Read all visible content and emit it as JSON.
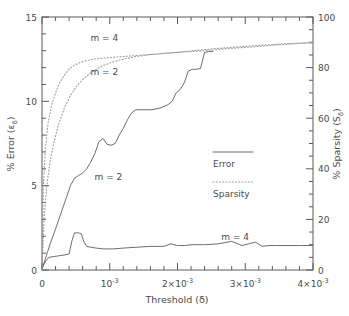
{
  "chart_data": {
    "type": "line",
    "title": "",
    "xlabel": "Threshold (δ)",
    "ylabel": "% Error (εδ)",
    "y2label": "% Sparsity (Sδ)",
    "xlim": [
      0,
      0.004
    ],
    "ylim": [
      0,
      15
    ],
    "y2lim": [
      0,
      100
    ],
    "grid": false,
    "legend_position": "center-right",
    "xticks": [
      0,
      0.001,
      0.002,
      0.003,
      0.004
    ],
    "xticklabels": [
      "0",
      "10⁻³",
      "2×10⁻³",
      "3×10⁻³",
      "4×10⁻³"
    ],
    "yticks": [
      0,
      5,
      10,
      15
    ],
    "yticklabels": [
      "0",
      "5",
      "10",
      "15"
    ],
    "y2ticks": [
      0,
      20,
      40,
      60,
      80,
      100
    ],
    "y2ticklabels": [
      "0",
      "20",
      "40",
      "60",
      "80",
      "100"
    ],
    "legend": [
      {
        "label": "Error",
        "style": "solid"
      },
      {
        "label": "Sparsity",
        "style": "dotted"
      }
    ],
    "annotations": [
      {
        "text": "m = 4",
        "x": 0.00092,
        "y": 13.6,
        "series": "sparsity-m4"
      },
      {
        "text": "m = 2",
        "x": 0.00092,
        "y": 11.55,
        "series": "sparsity-m2"
      },
      {
        "text": "m = 2",
        "x": 0.00098,
        "y": 5.35,
        "series": "error-m2"
      },
      {
        "text": "m = 4",
        "x": 0.00285,
        "y": 1.75,
        "series": "error-m4"
      }
    ],
    "series": [
      {
        "name": "Error m = 2",
        "axis": "left",
        "style": "solid",
        "label": "m = 2",
        "x": [
          0.0,
          4e-05,
          8e-05,
          0.00012,
          0.00018,
          0.00024,
          0.0003,
          0.00036,
          0.00042,
          0.00048,
          0.00054,
          0.0006,
          0.00066,
          0.00072,
          0.00078,
          0.00084,
          0.0009,
          0.00096,
          0.00102,
          0.00108,
          0.00114,
          0.0012,
          0.00126,
          0.00132,
          0.00138,
          0.0015,
          0.00162,
          0.00174,
          0.00186,
          0.00192,
          0.00198,
          0.00204,
          0.0021,
          0.00216,
          0.00222,
          0.00228,
          0.00234,
          0.0024,
          0.00246,
          0.00252
        ],
        "y": [
          0.05,
          0.55,
          1.05,
          1.55,
          2.2,
          2.9,
          3.6,
          4.3,
          5.0,
          5.45,
          5.6,
          5.75,
          6.0,
          6.4,
          6.9,
          7.6,
          7.8,
          7.45,
          7.4,
          7.5,
          8.0,
          8.4,
          8.9,
          9.3,
          9.5,
          9.5,
          9.5,
          9.6,
          9.8,
          10.0,
          10.5,
          10.7,
          11.1,
          11.8,
          11.9,
          11.9,
          11.95,
          12.9,
          12.95,
          12.95
        ]
      },
      {
        "name": "Error m = 4",
        "axis": "left",
        "style": "solid",
        "label": "m = 4",
        "x": [
          0.0,
          4e-05,
          0.0001,
          0.00018,
          0.00026,
          0.00034,
          0.0004,
          0.00044,
          0.00048,
          0.00054,
          0.00058,
          0.00062,
          0.00066,
          0.00072,
          0.0008,
          0.0009,
          0.00105,
          0.0012,
          0.0014,
          0.0016,
          0.0018,
          0.0019,
          0.002,
          0.0021,
          0.00222,
          0.0024,
          0.0026,
          0.0028,
          0.00295,
          0.00305,
          0.00315,
          0.00325,
          0.00335,
          0.00345,
          0.0036,
          0.0038,
          0.004
        ],
        "y": [
          0.05,
          0.45,
          0.75,
          0.8,
          0.85,
          0.9,
          0.95,
          1.7,
          2.2,
          2.2,
          2.15,
          1.65,
          1.4,
          1.35,
          1.3,
          1.25,
          1.25,
          1.3,
          1.35,
          1.4,
          1.4,
          1.55,
          1.45,
          1.45,
          1.5,
          1.5,
          1.55,
          1.7,
          1.45,
          1.55,
          1.65,
          1.4,
          1.45,
          1.45,
          1.45,
          1.45,
          1.45
        ]
      },
      {
        "name": "Sparsity m = 4",
        "axis": "right",
        "style": "dotted",
        "label": "m = 4",
        "x": [
          0.0,
          2e-05,
          5e-05,
          9e-05,
          0.00014,
          0.0002,
          0.00026,
          0.00033,
          0.0004,
          0.00048,
          0.00056,
          0.00066,
          0.00078,
          0.00092,
          0.0011,
          0.0013,
          0.00155,
          0.0018,
          0.0021,
          0.0024,
          0.0027,
          0.003,
          0.0033,
          0.0036,
          0.00385,
          0.004
        ],
        "y2": [
          0,
          33,
          48,
          58,
          65,
          70,
          74,
          77,
          79.5,
          81,
          82,
          82.8,
          83.4,
          83.8,
          84.2,
          84.6,
          85.1,
          85.6,
          86.2,
          86.7,
          87.4,
          88.0,
          88.6,
          89.2,
          89.6,
          89.8
        ]
      },
      {
        "name": "Sparsity m = 2",
        "axis": "right",
        "style": "dotted",
        "label": "m = 2",
        "x": [
          0.0,
          3e-05,
          7e-05,
          0.00012,
          0.00018,
          0.00025,
          0.00033,
          0.00042,
          0.00052,
          0.00063,
          0.00075,
          0.00088,
          0.00102,
          0.00118,
          0.00135,
          0.00155,
          0.0018,
          0.00205,
          0.0023,
          0.0026,
          0.0029,
          0.0032,
          0.0035,
          0.00378,
          0.004
        ],
        "y2": [
          0,
          20,
          33,
          43,
          51,
          58,
          64,
          69,
          73,
          76,
          78.5,
          80.5,
          82,
          83.2,
          84.2,
          85.0,
          85.6,
          86.2,
          86.9,
          87.6,
          88.2,
          88.8,
          89.3,
          89.7,
          89.9
        ]
      }
    ]
  }
}
